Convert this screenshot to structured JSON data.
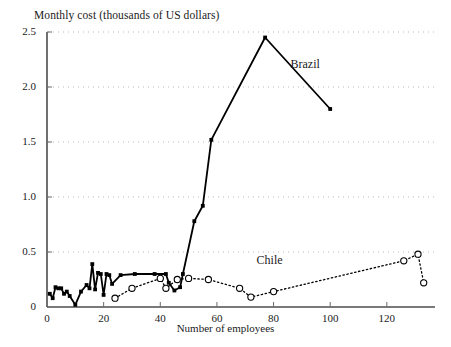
{
  "chart_data": {
    "type": "line",
    "title": "Monthly cost (thousands of US dollars)",
    "xlabel": "Number of employees",
    "ylabel": "Monthly cost (thousands of US dollars)",
    "xlim": [
      0,
      137
    ],
    "ylim": [
      0,
      2.5
    ],
    "xticks": [
      0,
      20,
      40,
      60,
      80,
      100,
      120
    ],
    "yticks": [
      0,
      0.5,
      1.0,
      1.5,
      2.0,
      2.5
    ],
    "ytick_labels": [
      "0",
      "0.5",
      "1.0",
      "1.5",
      "2.0",
      "2.5"
    ],
    "xtick_labels": [
      "0",
      "20",
      "40",
      "60",
      "80",
      "100",
      "120"
    ],
    "grid": "horizontal-dotted",
    "legend_position": "inline-annotation",
    "series": [
      {
        "name": "Brazil",
        "style": "solid-line-square-markers",
        "color": "#000000",
        "label_x": 86,
        "label_y": 2.2,
        "points": [
          {
            "x": 1,
            "y": 0.12
          },
          {
            "x": 2,
            "y": 0.08
          },
          {
            "x": 3,
            "y": 0.18
          },
          {
            "x": 4,
            "y": 0.17
          },
          {
            "x": 5,
            "y": 0.17
          },
          {
            "x": 6,
            "y": 0.12
          },
          {
            "x": 7,
            "y": 0.14
          },
          {
            "x": 8,
            "y": 0.1
          },
          {
            "x": 10,
            "y": 0.02
          },
          {
            "x": 12,
            "y": 0.14
          },
          {
            "x": 14,
            "y": 0.2
          },
          {
            "x": 15,
            "y": 0.17
          },
          {
            "x": 16,
            "y": 0.39
          },
          {
            "x": 17,
            "y": 0.16
          },
          {
            "x": 18,
            "y": 0.31
          },
          {
            "x": 19,
            "y": 0.3
          },
          {
            "x": 20,
            "y": 0.11
          },
          {
            "x": 21,
            "y": 0.3
          },
          {
            "x": 22,
            "y": 0.29
          },
          {
            "x": 23,
            "y": 0.21
          },
          {
            "x": 26,
            "y": 0.29
          },
          {
            "x": 31,
            "y": 0.3
          },
          {
            "x": 38,
            "y": 0.3
          },
          {
            "x": 42,
            "y": 0.3
          },
          {
            "x": 43,
            "y": 0.22
          },
          {
            "x": 45,
            "y": 0.15
          },
          {
            "x": 47,
            "y": 0.18
          },
          {
            "x": 48,
            "y": 0.3
          },
          {
            "x": 52,
            "y": 0.78
          },
          {
            "x": 55,
            "y": 0.92
          },
          {
            "x": 58,
            "y": 1.52
          },
          {
            "x": 77,
            "y": 2.45
          },
          {
            "x": 100,
            "y": 1.8
          }
        ]
      },
      {
        "name": "Chile",
        "style": "dotted-line-circle-markers",
        "color": "#000000",
        "label_x": 74,
        "label_y": 0.42,
        "points": [
          {
            "x": 24,
            "y": 0.08
          },
          {
            "x": 30,
            "y": 0.17
          },
          {
            "x": 40,
            "y": 0.26
          },
          {
            "x": 42,
            "y": 0.17
          },
          {
            "x": 46,
            "y": 0.25
          },
          {
            "x": 50,
            "y": 0.26
          },
          {
            "x": 57,
            "y": 0.25
          },
          {
            "x": 68,
            "y": 0.17
          },
          {
            "x": 72,
            "y": 0.09
          },
          {
            "x": 80,
            "y": 0.14
          },
          {
            "x": 126,
            "y": 0.42
          },
          {
            "x": 131,
            "y": 0.48
          },
          {
            "x": 133,
            "y": 0.22
          }
        ]
      }
    ]
  },
  "axes": {
    "title_text": "Monthly cost (thousands of US dollars)",
    "x_axis_title": "Number of employees"
  }
}
